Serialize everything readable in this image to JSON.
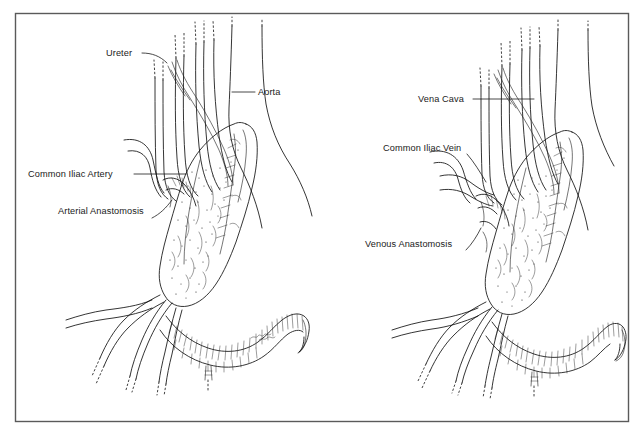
{
  "figure": {
    "background_color": "#ffffff",
    "frame_color": "#5a5a5a",
    "ink_color": "#111111",
    "label_color": "#1a1a1a",
    "panel_count": 2
  },
  "panels": [
    {
      "id": "arterial",
      "name": "Arterial Anastomosis View",
      "side": "left",
      "labels": [
        {
          "id": "ureter",
          "text": "Ureter",
          "x": 106,
          "y": 56,
          "anchor": "start"
        },
        {
          "id": "aorta",
          "text": "Aorta",
          "x": 258,
          "y": 95,
          "anchor": "start"
        },
        {
          "id": "common-iliac-artery",
          "text": "Common Iliac Artery",
          "x": 28,
          "y": 177,
          "anchor": "start"
        },
        {
          "id": "arterial-anastomosis",
          "text": "Arterial Anastomosis",
          "x": 58,
          "y": 214,
          "anchor": "start"
        }
      ]
    },
    {
      "id": "venous",
      "name": "Venous Anastomosis View",
      "side": "right",
      "labels": [
        {
          "id": "vena-cava",
          "text": "Vena Cava",
          "x": 418,
          "y": 102,
          "anchor": "start"
        },
        {
          "id": "common-iliac-vein",
          "text": "Common Iliac Vein",
          "x": 383,
          "y": 151,
          "anchor": "start"
        },
        {
          "id": "venous-anastomosis",
          "text": "Venous Anastomosis",
          "x": 365,
          "y": 247,
          "anchor": "start"
        }
      ]
    }
  ],
  "all_label_texts": [
    "Ureter",
    "Aorta",
    "Common Iliac Artery",
    "Arterial Anastomosis",
    "Vena Cava",
    "Common Iliac Vein",
    "Venous Anastomosis"
  ]
}
